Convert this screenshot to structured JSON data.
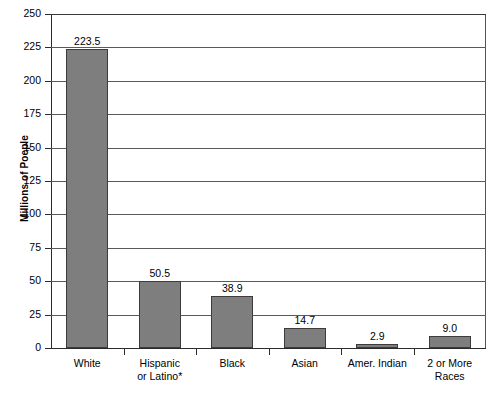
{
  "chart_data": {
    "type": "bar",
    "title": "",
    "xlabel": "",
    "ylabel": "Millions of Poeple",
    "ylim": [
      0,
      250
    ],
    "ytick_step": 25,
    "yticks": [
      250,
      225,
      200,
      175,
      150,
      125,
      100,
      75,
      50,
      25,
      0
    ],
    "ytick_labels": [
      "250",
      "225",
      "200",
      "175",
      "150",
      "125",
      "100",
      "75",
      "50",
      "25",
      "0"
    ],
    "grid": true,
    "grid_axis": "y",
    "legend": false,
    "bar_color": "#7e7e7e",
    "bar_edge_color": "#3c3c3c",
    "categories": [
      "White",
      "Hispanic or Latino*",
      "Black",
      "Asian",
      "Amer. Indian",
      "2 or More Races"
    ],
    "category_lines": [
      [
        "White"
      ],
      [
        "Hispanic",
        "or Latino*"
      ],
      [
        "Black"
      ],
      [
        "Asian"
      ],
      [
        "Amer. Indian"
      ],
      [
        "2 or More",
        "Races"
      ]
    ],
    "values": [
      223.5,
      50.5,
      38.9,
      14.7,
      2.9,
      9.0
    ],
    "value_labels": [
      "223.5",
      "50.5",
      "38.9",
      "14.7",
      "2.9",
      "9.0"
    ]
  },
  "caption": {
    "text": ""
  }
}
